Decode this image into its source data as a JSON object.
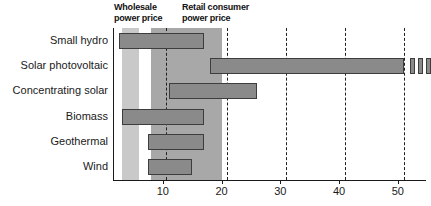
{
  "chart_data": {
    "type": "bar",
    "orientation": "horizontal",
    "title": "",
    "subtitle": "",
    "xlabel": "",
    "ylabel": "",
    "xlim": [
      0,
      55
    ],
    "grid": false,
    "legend_position": "top",
    "categories": [
      "Small hydro",
      "Solar photovoltaic",
      "Concentrating solar",
      "Biomass",
      "Geothermal",
      "Wind"
    ],
    "value_kind": "range",
    "series": [
      {
        "name": "Cost range",
        "ranges": [
          {
            "category": "Small hydro",
            "low": 2.5,
            "high": 17.0,
            "truncated": false
          },
          {
            "category": "Solar photovoltaic",
            "low": 18.0,
            "high": 51.0,
            "truncated": true
          },
          {
            "category": "Concentrating solar",
            "low": 11.0,
            "high": 26.0,
            "truncated": false
          },
          {
            "category": "Biomass",
            "low": 3.0,
            "high": 17.0,
            "truncated": false
          },
          {
            "category": "Geothermal",
            "low": 7.5,
            "high": 17.0,
            "truncated": false
          },
          {
            "category": "Wind",
            "low": 7.5,
            "high": 15.0,
            "truncated": false
          }
        ]
      }
    ],
    "xticks": [
      10,
      20,
      30,
      40,
      50
    ],
    "xtick_labels": [
      "10",
      "20",
      "30",
      "40",
      "50"
    ],
    "reference_lines": [
      {
        "value": 10.5,
        "style": "dashed"
      },
      {
        "value": 21.0,
        "style": "dashed"
      },
      {
        "value": 31.0,
        "style": "dashed"
      },
      {
        "value": 41.0,
        "style": "dashed"
      },
      {
        "value": 51.0,
        "style": "dashed"
      }
    ],
    "bands": [
      {
        "label": "Wholesale power price",
        "low": 3.0,
        "high": 6.0,
        "shade": "#c9c9c9"
      },
      {
        "label": "Retail consumer power price",
        "low": 8.0,
        "high": 20.0,
        "shade": "#a8a8a8"
      }
    ],
    "truncation_marks": {
      "count": 3,
      "after": 52.0
    }
  },
  "annotations": {
    "wholesale_caption": "Wholesale\npower price",
    "retail_caption": "Retail consumer\npower price"
  },
  "colors": {
    "bar_fill": "#8a8a8a",
    "bar_stroke": "#3d3d3d",
    "band_wholesale": "#c9c9c9",
    "band_retail": "#a8a8a8",
    "axis": "#1a1a1a",
    "text": "#1a1a1a"
  }
}
